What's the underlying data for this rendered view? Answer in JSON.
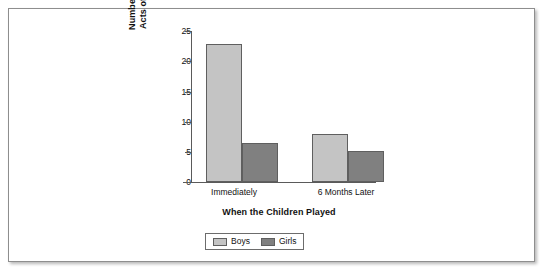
{
  "chart_data": {
    "type": "bar",
    "title": "",
    "subtitle": "",
    "xlabel": "When the Children Played",
    "ylabel": "Number of Imitative Acts of Aggression",
    "ylabel_lines": [
      "Number of Imitative",
      "Acts of Aggression"
    ],
    "categories": [
      "Immediately",
      "6 Months Later"
    ],
    "series": [
      {
        "name": "Boys",
        "values": [
          22.8,
          8.0
        ],
        "color": "#c4c4c4"
      },
      {
        "name": "Girls",
        "values": [
          6.5,
          5.1
        ],
        "color": "#808080"
      }
    ],
    "ylim": [
      0,
      25
    ],
    "yticks": [
      0,
      5,
      10,
      15,
      20,
      25
    ],
    "ytick_labels": [
      "0",
      "5",
      "10",
      "15",
      "20",
      "25"
    ],
    "grid": false,
    "legend_position": "bottom-center",
    "bar_border_color": "#5f5f5f",
    "axis_color": "#5a5a5a",
    "frame_color": "#8e8e8e",
    "background": "#ffffff"
  },
  "figure": {
    "y_axis_title_line1": "Number of Imitative",
    "y_axis_title_line2": "Acts of Aggression",
    "x_axis_title": "When the Children Played",
    "category_1": "Immediately",
    "category_2": "6 Months Later",
    "ytick_0": "0",
    "ytick_5": "5",
    "ytick_10": "10",
    "ytick_15": "15",
    "ytick_20": "20",
    "ytick_25": "25",
    "legend": {
      "boys_label": "Boys",
      "girls_label": "Girls"
    }
  }
}
